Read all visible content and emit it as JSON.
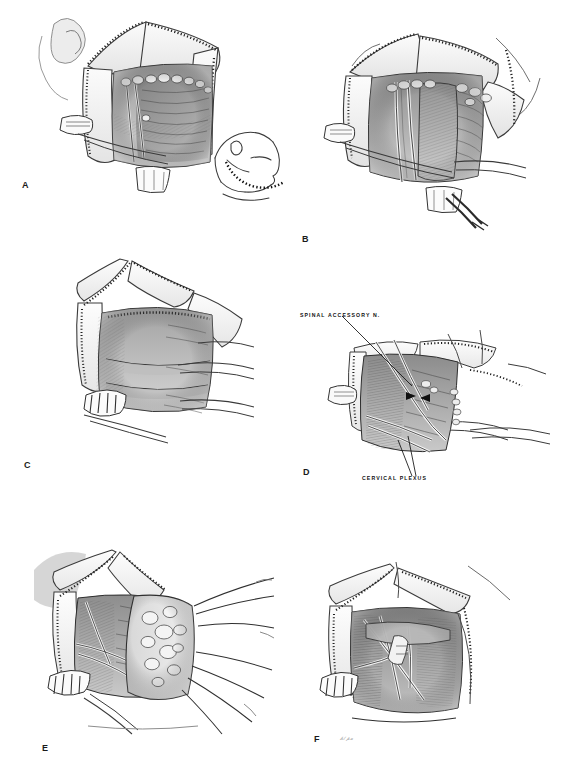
{
  "plate": {
    "title": "Radical neck dissection operative sequence",
    "background_color": "#ffffff",
    "ink_color": "#1a1a1a",
    "medium": "pen-and-ink wash medical illustration",
    "panel_count": 6,
    "width": 568,
    "height": 781
  },
  "panels": [
    {
      "id": "A",
      "letter": "A",
      "caption_position": "lower-left",
      "description": "Superficial exposure of the neck through a curved cervical incision; skin flaps reflected and held by stay sutures, platysma divided, lymph node chain visible along the upper border, sternocleidomastoid muscle exposed.",
      "has_inset": true,
      "inset": {
        "name": "head-and-neck-profile-inset",
        "description": "Line drawing of a patient's head and neck in profile showing the planned skin incision as a dashed line curving beneath the mandible",
        "incision_line_style": "dashed"
      }
    },
    {
      "id": "B",
      "letter": "B",
      "caption_position": "lower-left",
      "description": "Deeper dissection with flaps widely retracted; internal jugular vein and carotid sheath structures exposed, nodal tissue mobilized, surgical clamps and retractors in the field.",
      "has_inset": false
    },
    {
      "id": "C",
      "letter": "C",
      "caption_position": "lower-left",
      "description": "En bloc specimen elevated off the deep cervical fascia; multiple hemostats along the cut edge and retractors drawing the specimen medially.",
      "has_inset": false
    },
    {
      "id": "D",
      "letter": "D",
      "caption_position": "lower-left",
      "description": "Posterior triangle exposed after specimen removal, showing the preserved nerves crossing the floor of the dissection.",
      "has_inset": false,
      "annotations": [
        {
          "name": "spinal-accessory-nerve-label",
          "text": "SPINAL ACCESSORY N.",
          "leader": "line from label down-right to two arrowheads marking the nerve",
          "arrowheads": 2
        },
        {
          "name": "cervical-plexus-label",
          "text": "CERVICAL PLEXUS",
          "leader": "two lines rising from label to the plexus roots",
          "arrowheads": 0
        }
      ]
    },
    {
      "id": "E",
      "letter": "E",
      "caption_position": "lower-left",
      "description": "Specimen containing nodular lymph node packet drawn laterally on traction sutures; underlying strap and scalene musculature exposed.",
      "has_inset": false
    },
    {
      "id": "F",
      "letter": "F",
      "caption_position": "lower-left",
      "description": "Completed dissection bed with preserved great vessels and nerves crossing the cleared posterior triangle; artist's signature at lower edge.",
      "has_inset": false,
      "signature": "artist signature"
    }
  ],
  "labels": {
    "spinal_accessory": "SPINAL ACCESSORY N.",
    "cervical_plexus": "CERVICAL PLEXUS"
  },
  "panel_letters": {
    "a": "A",
    "b": "B",
    "c": "C",
    "d": "D",
    "e": "E",
    "f": "F"
  }
}
